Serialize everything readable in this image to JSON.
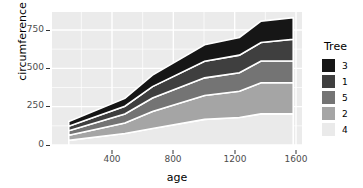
{
  "chart_data": {
    "type": "area",
    "title": "",
    "subtitle": "",
    "xlabel": "age",
    "ylabel": "circumference",
    "xlim": [
      118,
      1582
    ],
    "ylim": [
      0,
      870
    ],
    "xticks": [
      400,
      800,
      1200,
      1600
    ],
    "yticks": [
      0,
      250,
      500,
      750
    ],
    "grid": true,
    "legend": {
      "title": "Tree",
      "position": "right",
      "entries": [
        {
          "label": "3",
          "color": "#161616"
        },
        {
          "label": "1",
          "color": "#3f3f3f"
        },
        {
          "label": "5",
          "color": "#747474"
        },
        {
          "label": "2",
          "color": "#a5a5a5"
        },
        {
          "label": "4",
          "color": "#eaeaea"
        }
      ]
    },
    "stack_order_top_to_bottom": [
      "3",
      "1",
      "5",
      "2",
      "4"
    ],
    "x": [
      118,
      484,
      664,
      1004,
      1231,
      1372,
      1582
    ],
    "series": [
      {
        "name": "4",
        "color": "#eaeaea",
        "values": [
          30,
          75,
          108,
          167,
          179,
          203,
          203
        ]
      },
      {
        "name": "2",
        "color": "#a5a5a5",
        "values": [
          33,
          69,
          111,
          156,
          172,
          203,
          203
        ]
      },
      {
        "name": "5",
        "color": "#747474",
        "values": [
          30,
          58,
          87,
          115,
          120,
          142,
          142
        ]
      },
      {
        "name": "1",
        "color": "#3f3f3f",
        "values": [
          30,
          51,
          75,
          108,
          115,
          120,
          142
        ]
      },
      {
        "name": "3",
        "color": "#161616",
        "values": [
          30,
          51,
          75,
          108,
          115,
          140,
          140
        ]
      }
    ],
    "cumulative_totals": [
      153,
      304,
      456,
      654,
      701,
      808,
      830
    ],
    "panel": {
      "background": "#ebebeb",
      "gridline_color": "#ffffff",
      "minor_grid": true
    }
  },
  "axes": {
    "y_title": "circumference",
    "x_title": "age",
    "y_tick_labels": [
      "750",
      "500",
      "250",
      "0"
    ],
    "x_tick_labels": [
      "400",
      "800",
      "1200",
      "1600"
    ]
  },
  "legend": {
    "title": "Tree",
    "labels": [
      "3",
      "1",
      "5",
      "2",
      "4"
    ]
  }
}
